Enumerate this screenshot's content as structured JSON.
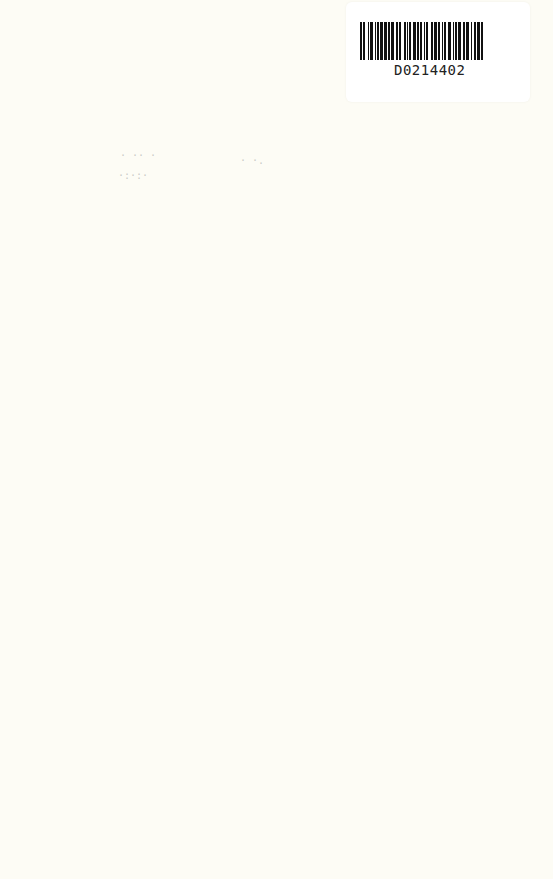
{
  "barcode": {
    "code": "D0214402",
    "bar_widths": [
      2,
      1,
      2,
      3,
      1,
      1,
      3,
      2,
      1,
      1,
      2,
      1,
      3,
      1,
      3,
      1,
      2,
      1,
      3,
      2,
      2,
      1,
      2,
      3,
      2,
      1,
      1,
      1,
      2,
      2,
      3,
      1,
      2,
      1,
      2,
      2,
      1,
      1,
      2,
      3,
      2,
      1,
      3,
      1,
      2,
      2,
      1,
      1,
      2,
      2,
      3,
      2,
      1,
      1,
      2,
      1,
      3,
      2,
      2,
      1,
      3,
      2,
      1,
      2,
      2,
      1,
      3,
      1,
      2,
      2
    ]
  },
  "page": {
    "background_color": "#fdfcf5"
  }
}
